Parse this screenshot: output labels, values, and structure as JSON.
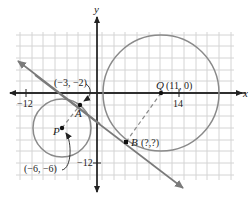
{
  "axes": {
    "x_label": "x",
    "y_label": "y",
    "tick_labels": {
      "x_neg": "−12",
      "x_pos": "14",
      "y_neg": "−12"
    }
  },
  "points": {
    "Q": {
      "name": "Q",
      "coords": "(11, 0)"
    },
    "P": {
      "name": "P",
      "coords": "(−6, −6)"
    },
    "A": {
      "name": "A",
      "coords": "(−3, −2)"
    },
    "B": {
      "name": "B",
      "coords": "(?,?)"
    }
  },
  "colors": {
    "grid": "#d4d4d4",
    "axis": "#222222",
    "circle": "#8a8a8a",
    "tangent": "#7a7a7a",
    "dashed": "#8a8a8a",
    "point": "#111111"
  }
}
